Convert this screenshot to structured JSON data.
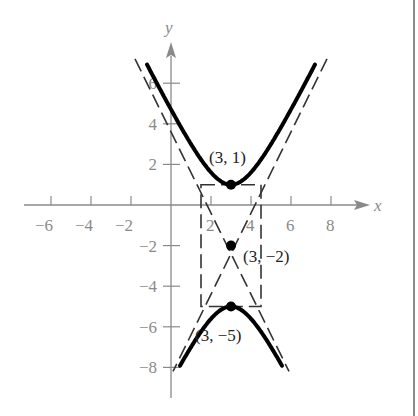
{
  "chart_data": {
    "type": "line",
    "title": "",
    "xlabel": "x",
    "ylabel": "y",
    "xlim": [
      -7.5,
      10
    ],
    "ylim": [
      -9,
      7.5
    ],
    "grid": false,
    "x_ticks": [
      -6,
      -4,
      -2,
      2,
      4,
      6,
      8
    ],
    "x_tick_labels": [
      "−6",
      "−4",
      "−2",
      "2",
      "4",
      "6",
      "8"
    ],
    "y_ticks": [
      6,
      4,
      2,
      -2,
      -4,
      -6,
      -8
    ],
    "y_tick_labels": [
      "6",
      "4",
      "2",
      "−2",
      "−4",
      "−6",
      "−8"
    ],
    "hyperbola": {
      "h": 3,
      "k": -2,
      "a": 3,
      "b": 1.5,
      "orientation": "vertical"
    },
    "points": [
      {
        "x": 3,
        "y": 1,
        "label": "(3, 1)"
      },
      {
        "x": 3,
        "y": -2,
        "label": "(3, −2)"
      },
      {
        "x": 3,
        "y": -5,
        "label": "(3, −5)"
      }
    ],
    "asymptotes": [
      {
        "slope": 2,
        "intercept": -8,
        "style": "dashed"
      },
      {
        "slope": -2,
        "intercept": 4,
        "style": "dashed"
      }
    ],
    "rectangle": {
      "x": [
        1.5,
        4.5
      ],
      "y": [
        -5,
        1
      ],
      "style": "dashed"
    }
  }
}
